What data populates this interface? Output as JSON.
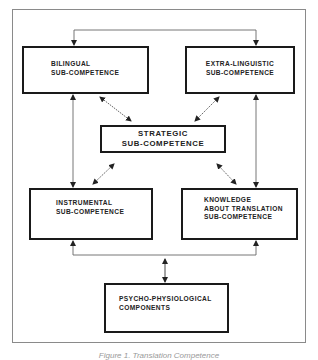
{
  "diagram": {
    "title_caption": "Figure 1. Translation Competence",
    "colors": {
      "box_border": "#1a1a1a",
      "connector": "#555555",
      "frame": "#8a8a8a",
      "text": "#222222"
    },
    "nodes": [
      {
        "id": "bilingual",
        "lines": [
          "BILINGUAL",
          "SUB-COMPETENCE"
        ]
      },
      {
        "id": "extra_linguistic",
        "lines": [
          "EXTRA-LINGUISTIC",
          "SUB-COMPETENCE"
        ]
      },
      {
        "id": "strategic",
        "lines": [
          "STRATEGIC",
          "SUB-COMPETENCE"
        ]
      },
      {
        "id": "instrumental",
        "lines": [
          "INSTRUMENTAL",
          "SUB-COMPETENCE"
        ]
      },
      {
        "id": "knowledge",
        "lines": [
          "KNOWLEDGE",
          "ABOUT TRANSLATION",
          "SUB-COMPETENCE"
        ]
      },
      {
        "id": "psycho",
        "lines": [
          "PSYCHO-PHYSIOLOGICAL",
          "COMPONENTS"
        ]
      }
    ],
    "edges": [
      {
        "from": "bilingual",
        "to": "extra_linguistic",
        "type": "bidirectional",
        "route": "top bracket"
      },
      {
        "from": "bilingual",
        "to": "instrumental",
        "type": "bidirectional",
        "route": "left vertical"
      },
      {
        "from": "extra_linguistic",
        "to": "knowledge",
        "type": "bidirectional",
        "route": "right vertical"
      },
      {
        "from": "bilingual",
        "to": "strategic",
        "type": "bidirectional",
        "route": "diagonal dotted"
      },
      {
        "from": "extra_linguistic",
        "to": "strategic",
        "type": "bidirectional",
        "route": "diagonal dotted"
      },
      {
        "from": "instrumental",
        "to": "strategic",
        "type": "bidirectional",
        "route": "diagonal dotted"
      },
      {
        "from": "knowledge",
        "to": "strategic",
        "type": "bidirectional",
        "route": "diagonal dotted"
      },
      {
        "from": "psycho",
        "to": "instrumental",
        "type": "bidirectional",
        "route": "bottom bracket"
      },
      {
        "from": "psycho",
        "to": "knowledge",
        "type": "bidirectional",
        "route": "bottom bracket"
      }
    ]
  }
}
